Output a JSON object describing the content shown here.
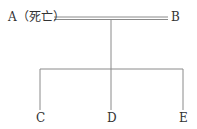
{
  "diagram": {
    "type": "family-tree",
    "nodes": {
      "a": {
        "label": "A（死亡）"
      },
      "b": {
        "label": "B"
      },
      "c": {
        "label": "C"
      },
      "d": {
        "label": "D"
      },
      "e": {
        "label": "E"
      }
    },
    "edges": [
      {
        "from": "A",
        "to": "B",
        "style": "double-line",
        "meaning": "marriage"
      },
      {
        "from": "A+B",
        "to": "C",
        "style": "single-line"
      },
      {
        "from": "A+B",
        "to": "D",
        "style": "single-line"
      },
      {
        "from": "A+B",
        "to": "E",
        "style": "single-line"
      }
    ],
    "line_color": "#8a8a8a",
    "text_color": "#333333"
  }
}
